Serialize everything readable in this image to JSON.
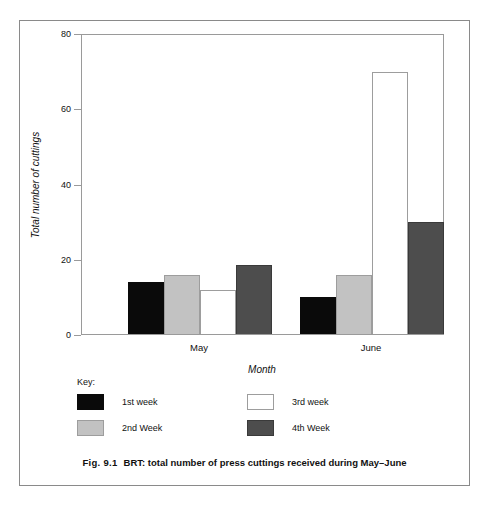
{
  "figure": {
    "caption_prefix": "Fig. 9.1",
    "caption_text": "BRT: total number of press cuttings received during May–June"
  },
  "chart_data": {
    "type": "bar",
    "title": "",
    "xlabel": "Month",
    "ylabel": "Total number of cuttings",
    "categories": [
      "May",
      "June"
    ],
    "series": [
      {
        "name": "1st week",
        "values": [
          14,
          10
        ],
        "color": "#0a0a0a"
      },
      {
        "name": "2nd Week",
        "values": [
          16,
          16
        ],
        "color": "#c2c2c2"
      },
      {
        "name": "3rd week",
        "values": [
          12,
          70
        ],
        "color": "#ffffff"
      },
      {
        "name": "4th Week",
        "values": [
          18.5,
          30
        ],
        "color": "#4d4d4d"
      }
    ],
    "ylim": [
      0,
      80
    ],
    "yticks": [
      0,
      20,
      40,
      60,
      80
    ],
    "ytick_labels": [
      "0",
      "20",
      "40",
      "60",
      "80"
    ],
    "grid": false,
    "legend_position": "below-plot"
  },
  "legend": {
    "title": "Key:",
    "entries": [
      {
        "label": "1st week",
        "swatch": "swatch-1st"
      },
      {
        "label": "2nd Week",
        "swatch": "swatch-2nd"
      },
      {
        "label": "3rd week",
        "swatch": "swatch-3rd"
      },
      {
        "label": "4th Week",
        "swatch": "swatch-4th"
      }
    ]
  }
}
